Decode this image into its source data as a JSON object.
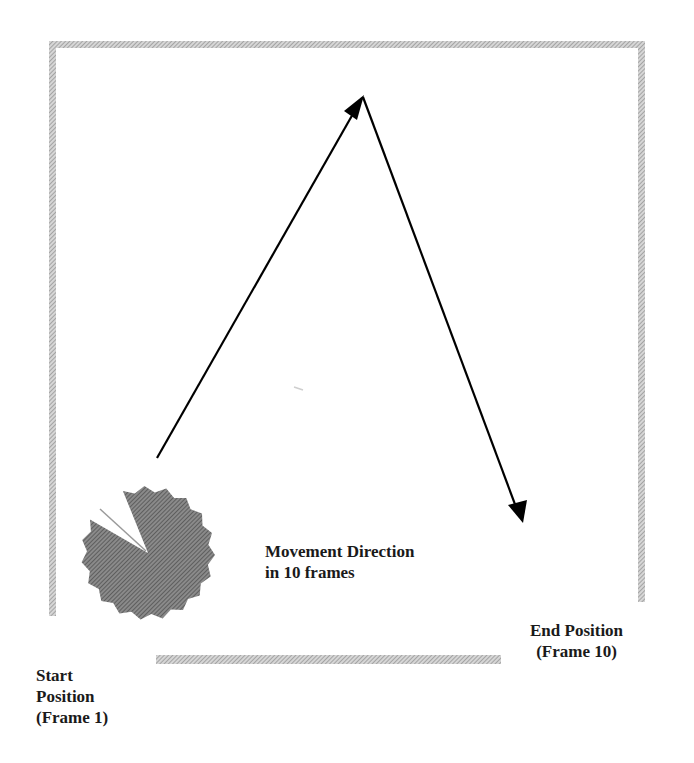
{
  "diagram": {
    "type": "motion-path",
    "labels": {
      "movement": [
        "Movement Direction",
        "in 10 frames"
      ],
      "start": [
        "Start",
        "Position",
        "(Frame 1)"
      ],
      "end": [
        "End Position",
        "(Frame 10)"
      ]
    },
    "colors": {
      "border_hatch": "#a9a9a9",
      "pacman_fill": "#7a7a7a",
      "arrow": "#000000",
      "text": "#1a1a1a",
      "background": "#ffffff"
    },
    "frames": {
      "start": 1,
      "end": 10
    }
  }
}
